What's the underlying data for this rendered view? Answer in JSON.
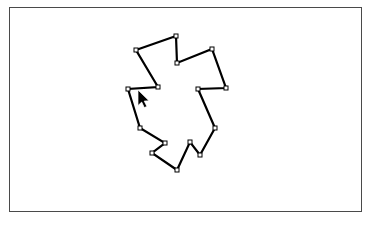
{
  "window": {
    "title": "Polygon Canvas",
    "background_color": "#ffffff"
  },
  "canvas": {
    "name": "drawing-canvas",
    "background_color": "#ffffff",
    "border_color": "#4a4a4a",
    "border_width": 1,
    "x": 9,
    "y": 7,
    "width": 353,
    "height": 205
  },
  "shape": {
    "name": "closed-polygon-path",
    "type": "polygon",
    "closed": true,
    "stroke_color": "#000000",
    "stroke_width": 2.2,
    "fill": "none",
    "vertex_count": 15,
    "vertex_handle": {
      "shape": "square",
      "size": 4,
      "fill_color": "#ffffff",
      "stroke_color": "#000000",
      "stroke_width": 1
    },
    "points": [
      [
        136,
        50
      ],
      [
        176,
        36
      ],
      [
        177,
        63
      ],
      [
        212,
        49
      ],
      [
        226,
        88
      ],
      [
        198,
        89
      ],
      [
        215,
        128
      ],
      [
        200,
        155
      ],
      [
        190,
        142
      ],
      [
        177,
        170
      ],
      [
        152,
        153
      ],
      [
        165,
        143
      ],
      [
        140,
        128
      ],
      [
        128,
        89
      ],
      [
        158,
        87
      ]
    ]
  },
  "cursor": {
    "name": "mouse-pointer",
    "type": "arrow",
    "x": 138,
    "y": 90,
    "fill_color": "#000000",
    "outline_color": "#ffffff"
  }
}
